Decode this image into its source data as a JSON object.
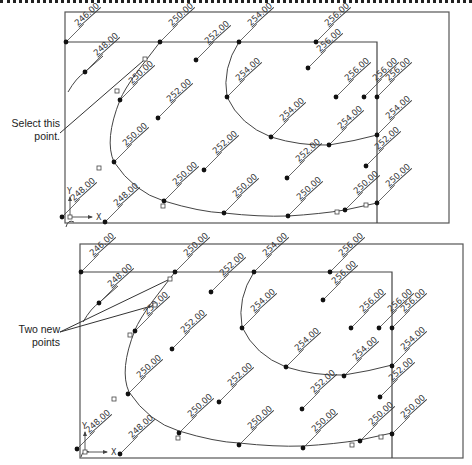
{
  "callouts": {
    "top": {
      "line1": "Select this",
      "line2": "point."
    },
    "bottom": {
      "line1": "Two new",
      "line2": "points"
    }
  },
  "ucs": {
    "x_label": "X",
    "y_label": "Y"
  },
  "panels": [
    {
      "name": "before",
      "outer_rect": [
        65,
        12,
        449,
        223
      ],
      "inner_top_y": 42,
      "inner_right_x": 377,
      "points": [
        {
          "x": 66,
          "y": 42,
          "label": "246.00"
        },
        {
          "x": 85,
          "y": 72,
          "label": "248.00"
        },
        {
          "x": 160,
          "y": 42,
          "label": "250.00"
        },
        {
          "x": 120,
          "y": 100,
          "label": "250.00"
        },
        {
          "x": 196,
          "y": 60,
          "label": "252.00"
        },
        {
          "x": 158,
          "y": 118,
          "label": "252.00"
        },
        {
          "x": 239,
          "y": 42,
          "label": "254.00"
        },
        {
          "x": 316,
          "y": 42,
          "label": "256.00"
        },
        {
          "x": 308,
          "y": 68,
          "label": "256.00"
        },
        {
          "x": 336,
          "y": 97,
          "label": "256.00"
        },
        {
          "x": 364,
          "y": 97,
          "label": "256.00"
        },
        {
          "x": 377,
          "y": 97,
          "label": "256.00"
        },
        {
          "x": 227,
          "y": 97,
          "label": "254.00"
        },
        {
          "x": 271,
          "y": 137,
          "label": "254.00"
        },
        {
          "x": 329,
          "y": 145,
          "label": "254.00"
        },
        {
          "x": 377,
          "y": 135,
          "label": "254.00"
        },
        {
          "x": 287,
          "y": 178,
          "label": "252.00"
        },
        {
          "x": 366,
          "y": 166,
          "label": "252.00"
        },
        {
          "x": 204,
          "y": 170,
          "label": "252.00"
        },
        {
          "x": 114,
          "y": 162,
          "label": "250.00"
        },
        {
          "x": 164,
          "y": 201,
          "label": "250.00"
        },
        {
          "x": 224,
          "y": 213,
          "label": "250.00"
        },
        {
          "x": 288,
          "y": 216,
          "label": "250.00"
        },
        {
          "x": 345,
          "y": 210,
          "label": "250.00"
        },
        {
          "x": 377,
          "y": 203,
          "label": "250.00"
        },
        {
          "x": 62,
          "y": 217,
          "label": "248.00"
        },
        {
          "x": 105,
          "y": 222,
          "label": "248.00"
        }
      ],
      "small_squares": [
        [
          145,
          59
        ],
        [
          117,
          91
        ],
        [
          99,
          168
        ],
        [
          163,
          206
        ],
        [
          337,
          212
        ],
        [
          366,
          205
        ]
      ]
    },
    {
      "name": "after",
      "outer_rect": [
        80,
        244,
        463,
        458
      ],
      "inner_top_y": 272,
      "inner_right_x": 392,
      "points": [
        {
          "x": 81,
          "y": 272,
          "label": "246.00"
        },
        {
          "x": 99,
          "y": 303,
          "label": "248.00"
        },
        {
          "x": 175,
          "y": 272,
          "label": "250.00"
        },
        {
          "x": 135,
          "y": 331,
          "label": "250.00"
        },
        {
          "x": 211,
          "y": 292,
          "label": "252.00"
        },
        {
          "x": 172,
          "y": 349,
          "label": "252.00"
        },
        {
          "x": 254,
          "y": 272,
          "label": "254.00"
        },
        {
          "x": 330,
          "y": 272,
          "label": "256.00"
        },
        {
          "x": 323,
          "y": 300,
          "label": "256.00"
        },
        {
          "x": 351,
          "y": 328,
          "label": "256.00"
        },
        {
          "x": 379,
          "y": 328,
          "label": "256.00"
        },
        {
          "x": 392,
          "y": 328,
          "label": "256.00"
        },
        {
          "x": 242,
          "y": 328,
          "label": "254.00"
        },
        {
          "x": 286,
          "y": 367,
          "label": "254.00"
        },
        {
          "x": 344,
          "y": 376,
          "label": "254.00"
        },
        {
          "x": 392,
          "y": 366,
          "label": "254.00"
        },
        {
          "x": 302,
          "y": 409,
          "label": "252.00"
        },
        {
          "x": 380,
          "y": 397,
          "label": "252.00"
        },
        {
          "x": 219,
          "y": 402,
          "label": "252.00"
        },
        {
          "x": 128,
          "y": 394,
          "label": "250.00"
        },
        {
          "x": 179,
          "y": 433,
          "label": "250.00"
        },
        {
          "x": 239,
          "y": 445,
          "label": "250.00"
        },
        {
          "x": 303,
          "y": 448,
          "label": "250.00"
        },
        {
          "x": 360,
          "y": 441,
          "label": "250.00"
        },
        {
          "x": 392,
          "y": 434,
          "label": "250.00"
        },
        {
          "x": 77,
          "y": 449,
          "label": "248.00"
        },
        {
          "x": 120,
          "y": 454,
          "label": "248.00"
        }
      ],
      "small_squares": [
        [
          170,
          279
        ],
        [
          155,
          305
        ],
        [
          130,
          335
        ],
        [
          114,
          399
        ],
        [
          178,
          438
        ],
        [
          352,
          445
        ],
        [
          381,
          437
        ]
      ]
    }
  ]
}
